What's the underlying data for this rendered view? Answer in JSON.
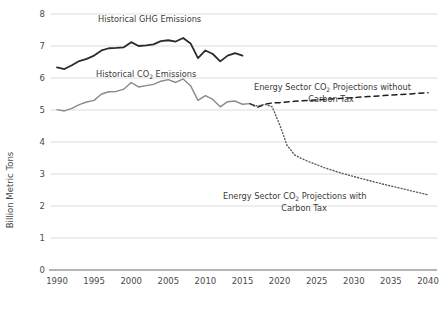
{
  "chart_data": {
    "type": "line",
    "title": "",
    "xlabel": "",
    "ylabel": "Billion Metric Tons",
    "xlim": [
      1990,
      2040
    ],
    "ylim": [
      0,
      8
    ],
    "xticks": [
      "1990",
      "1995",
      "2000",
      "2005",
      "2010",
      "2015",
      "2020",
      "2025",
      "2030",
      "2035",
      "2040"
    ],
    "yticks": [
      "0",
      "1",
      "2",
      "3",
      "4",
      "5",
      "6",
      "7",
      "8"
    ],
    "grid": "horizontal",
    "legend": "inline-annotations",
    "annotations": [
      {
        "id": "ghg",
        "text": "Historical GHG Emissions",
        "x": 1990,
        "y": 7.72
      },
      {
        "id": "co2",
        "text": "Historical CO2 Emissions",
        "text_pre": "Historical CO",
        "text_sub": "2",
        "text_post": " Emissions",
        "x": 1990,
        "y": 6.33
      },
      {
        "id": "no_tax",
        "text_line1_pre": "Energy Sector CO",
        "text_line1_sub": "2",
        "text_line1_post": " Projections without",
        "text_line2": "Carbon Tax"
      },
      {
        "id": "tax",
        "text_line1_pre": "Energy Sector CO",
        "text_line1_sub": "2",
        "text_line1_post": " Projections with",
        "text_line2": "Carbon Tax"
      }
    ],
    "series": [
      {
        "name": "Historical GHG Emissions",
        "style": "solid",
        "color": "#2b2b2b",
        "width": 1.8,
        "x": [
          1990,
          1991,
          1992,
          1993,
          1994,
          1995,
          1996,
          1997,
          1998,
          1999,
          2000,
          2001,
          2002,
          2003,
          2004,
          2005,
          2006,
          2007,
          2008,
          2009,
          2010,
          2011,
          2012,
          2013,
          2014,
          2015
        ],
        "values": [
          6.33,
          6.28,
          6.4,
          6.53,
          6.6,
          6.7,
          6.86,
          6.93,
          6.94,
          6.96,
          7.12,
          7.0,
          7.02,
          7.05,
          7.15,
          7.18,
          7.14,
          7.25,
          7.08,
          6.62,
          6.86,
          6.75,
          6.52,
          6.7,
          6.78,
          6.7
        ]
      },
      {
        "name": "Historical CO2 Emissions",
        "style": "solid",
        "color": "#8a8a8a",
        "width": 1.4,
        "x": [
          1990,
          1991,
          1992,
          1993,
          1994,
          1995,
          1996,
          1997,
          1998,
          1999,
          2000,
          2001,
          2002,
          2003,
          2004,
          2005,
          2006,
          2007,
          2008,
          2009,
          2010,
          2011,
          2012,
          2013,
          2014,
          2015,
          2016
        ],
        "values": [
          5.01,
          4.97,
          5.05,
          5.17,
          5.25,
          5.3,
          5.5,
          5.57,
          5.58,
          5.65,
          5.86,
          5.72,
          5.76,
          5.8,
          5.9,
          5.95,
          5.86,
          5.97,
          5.76,
          5.3,
          5.45,
          5.33,
          5.1,
          5.26,
          5.28,
          5.18,
          5.2
        ]
      },
      {
        "name": "Energy Sector CO2 Projections without Carbon Tax",
        "style": "dashed",
        "color": "#1f1f1f",
        "width": 1.5,
        "x": [
          2016,
          2017,
          2018,
          2019,
          2020,
          2022,
          2024,
          2026,
          2028,
          2030,
          2032,
          2034,
          2036,
          2038,
          2040
        ],
        "values": [
          5.2,
          5.08,
          5.18,
          5.22,
          5.23,
          5.27,
          5.3,
          5.33,
          5.36,
          5.39,
          5.42,
          5.45,
          5.48,
          5.51,
          5.54
        ]
      },
      {
        "name": "Energy Sector CO2 Projections with Carbon Tax",
        "style": "dotted",
        "color": "#5a5a5a",
        "width": 1.4,
        "x": [
          2016,
          2017,
          2018,
          2019,
          2020,
          2021,
          2022,
          2023,
          2024,
          2026,
          2028,
          2030,
          2032,
          2034,
          2036,
          2038,
          2040
        ],
        "values": [
          5.2,
          5.12,
          5.18,
          5.1,
          4.55,
          3.9,
          3.6,
          3.48,
          3.38,
          3.2,
          3.05,
          2.92,
          2.8,
          2.68,
          2.57,
          2.46,
          2.35
        ]
      }
    ]
  },
  "axis": {
    "y_title": "Billion Metric Tons"
  }
}
